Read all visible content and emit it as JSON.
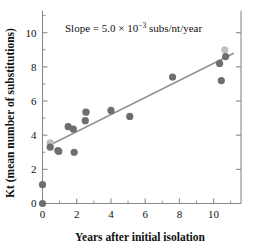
{
  "chart_data": {
    "type": "scatter",
    "title": "",
    "xlabel": "Years after initial isolation",
    "ylabel": "Kt (mean number of substitutions)",
    "xlim": [
      0,
      11.6
    ],
    "ylim": [
      0,
      11.3
    ],
    "xticks": [
      0,
      2,
      4,
      6,
      8,
      10
    ],
    "xticklabels": [
      "0",
      "2",
      "4",
      "6",
      "8",
      "10"
    ],
    "xminorticks": [
      1,
      3,
      5,
      7,
      9,
      11
    ],
    "yticks": [
      0,
      2,
      4,
      6,
      8,
      10
    ],
    "yticklabels": [
      "0",
      "2",
      "4",
      "6",
      "8",
      "10"
    ],
    "yminorticks": [
      1,
      3,
      5,
      7,
      9,
      11
    ],
    "grid": false,
    "legend": null,
    "annotations": [
      {
        "name": "slope-annotation",
        "text_parts": {
          "lead": "Slope = 5.0",
          "times": "×",
          "base": "10",
          "exponent": "−3",
          "units": "subs/nt/year"
        },
        "full_text": "Slope = 5.0 × 10−3 subs/nt/year",
        "x": 2.0,
        "y": 10.4
      }
    ],
    "fit_line": {
      "name": "regression-line",
      "slope": 0.5,
      "intercept": 3.2,
      "x_start": 0.35,
      "x_end": 11.15,
      "y_start": 3.38,
      "y_end": 8.78,
      "color": "#909090"
    },
    "series": [
      {
        "name": "dark-markers",
        "color": "#6e6e6e",
        "marker": "circle",
        "points": [
          {
            "x": 0.0,
            "y": 0.0
          },
          {
            "x": 0.0,
            "y": 1.1
          },
          {
            "x": 0.45,
            "y": 3.3
          },
          {
            "x": 0.9,
            "y": 3.1
          },
          {
            "x": 0.95,
            "y": 3.05
          },
          {
            "x": 1.5,
            "y": 4.5
          },
          {
            "x": 1.8,
            "y": 4.35
          },
          {
            "x": 1.85,
            "y": 3.0
          },
          {
            "x": 2.5,
            "y": 4.85
          },
          {
            "x": 2.55,
            "y": 5.35
          },
          {
            "x": 4.0,
            "y": 5.45
          },
          {
            "x": 5.1,
            "y": 5.1
          },
          {
            "x": 7.6,
            "y": 7.4
          },
          {
            "x": 10.35,
            "y": 8.2
          },
          {
            "x": 10.45,
            "y": 7.2
          },
          {
            "x": 10.7,
            "y": 8.6
          }
        ]
      },
      {
        "name": "light-markers",
        "color": "#c0c0c0",
        "marker": "circle",
        "points": [
          {
            "x": 0.45,
            "y": 3.55
          },
          {
            "x": 2.5,
            "y": 5.35
          },
          {
            "x": 10.65,
            "y": 9.0
          }
        ]
      }
    ]
  }
}
